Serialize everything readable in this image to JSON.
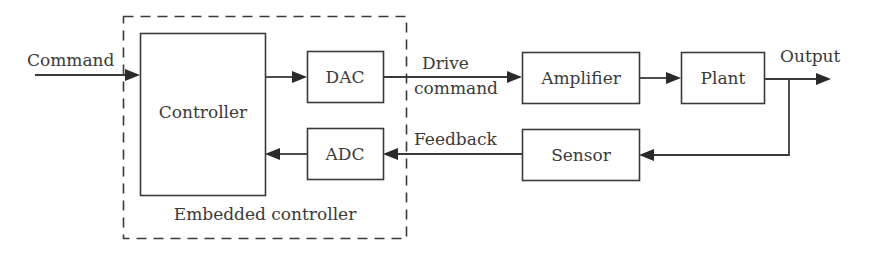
{
  "diagram": {
    "type": "block-diagram",
    "colors": {
      "stroke": "#3a3a3a",
      "text": "#3a3a3a",
      "background": "#ffffff"
    },
    "group": {
      "label": "Embedded controller",
      "style": "dashed"
    },
    "blocks": {
      "controller": "Controller",
      "dac": "DAC",
      "adc": "ADC",
      "amplifier": "Amplifier",
      "plant": "Plant",
      "sensor": "Sensor"
    },
    "signals": {
      "command": "Command",
      "drive_line1": "Drive",
      "drive_line2": "command",
      "output": "Output",
      "feedback": "Feedback"
    },
    "connections": [
      {
        "from": "Command",
        "to": "Controller"
      },
      {
        "from": "Controller",
        "to": "DAC"
      },
      {
        "from": "DAC",
        "to": "Amplifier",
        "label": "Drive command"
      },
      {
        "from": "Amplifier",
        "to": "Plant"
      },
      {
        "from": "Plant",
        "to": "Output"
      },
      {
        "from": "Plant",
        "to": "Sensor"
      },
      {
        "from": "Sensor",
        "to": "ADC",
        "label": "Feedback"
      },
      {
        "from": "ADC",
        "to": "Controller"
      }
    ]
  }
}
